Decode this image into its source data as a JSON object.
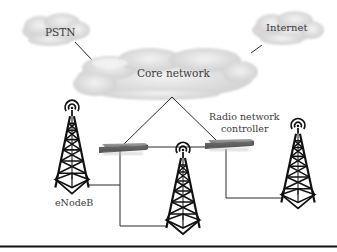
{
  "diagram": {
    "clouds": {
      "pstn": {
        "label": "PSTN"
      },
      "internet": {
        "label": "Internet"
      },
      "core": {
        "label": "Core network"
      }
    },
    "labels": {
      "rnc_line1": "Radio network",
      "rnc_line2": "controller",
      "enodeb": "eNodeB"
    },
    "nodes": {
      "switches": [
        "rnc-left",
        "rnc-right"
      ],
      "towers": [
        "enodeb-left",
        "enodeb-middle",
        "enodeb-right"
      ]
    },
    "colors": {
      "cloud_fill": "#d9d9d9",
      "line": "#2a2a2a",
      "switch_fill": "#8a8a8a",
      "tower": "#111111",
      "bottom_rule": "#111111"
    }
  }
}
